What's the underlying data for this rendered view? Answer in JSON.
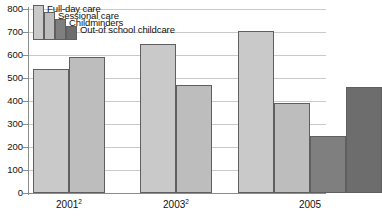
{
  "chart_data": {
    "type": "bar",
    "title": "",
    "subtitle": "",
    "xlabel": "",
    "ylabel": "",
    "categories": [
      "2001²",
      "2003²",
      "2005"
    ],
    "category_labels": [
      {
        "text": "2001",
        "sup": "2"
      },
      {
        "text": "2003",
        "sup": "2"
      },
      {
        "text": "2005",
        "sup": ""
      }
    ],
    "series": [
      {
        "name": "Full-day care",
        "color": "#c9c9c9",
        "values": [
          540,
          650,
          705
        ]
      },
      {
        "name": "Sessional care",
        "color": "#bdbdbd",
        "values": [
          590,
          468,
          392
        ]
      },
      {
        "name": "Childminders",
        "color": "#7f7f7f",
        "values": [
          null,
          null,
          248
        ]
      },
      {
        "name": "Out-of school childcare",
        "color": "#6d6d6d",
        "values": [
          null,
          null,
          463
        ]
      }
    ],
    "ylim": [
      0,
      800
    ],
    "yticks": [
      0,
      100,
      200,
      300,
      400,
      500,
      600,
      700,
      800
    ],
    "ytick_labels": [
      "0",
      "100",
      "200",
      "300",
      "400",
      "500",
      "600",
      "700",
      "800"
    ],
    "grid": true,
    "grid_axis": "y",
    "legend_position": "top-left",
    "legend": [
      {
        "label": "Full-day care",
        "color": "#c9c9c9"
      },
      {
        "label": "Sessional care",
        "color": "#bdbdbd"
      },
      {
        "label": "Childminders",
        "color": "#7f7f7f"
      },
      {
        "label": "Out-of school childcare",
        "color": "#6d6d6d"
      }
    ],
    "bar_border_color": "#5f5f5f",
    "axis_color": "#8c8c8c",
    "gridline_color": "#c9c9c9",
    "background": "#ffffff"
  }
}
